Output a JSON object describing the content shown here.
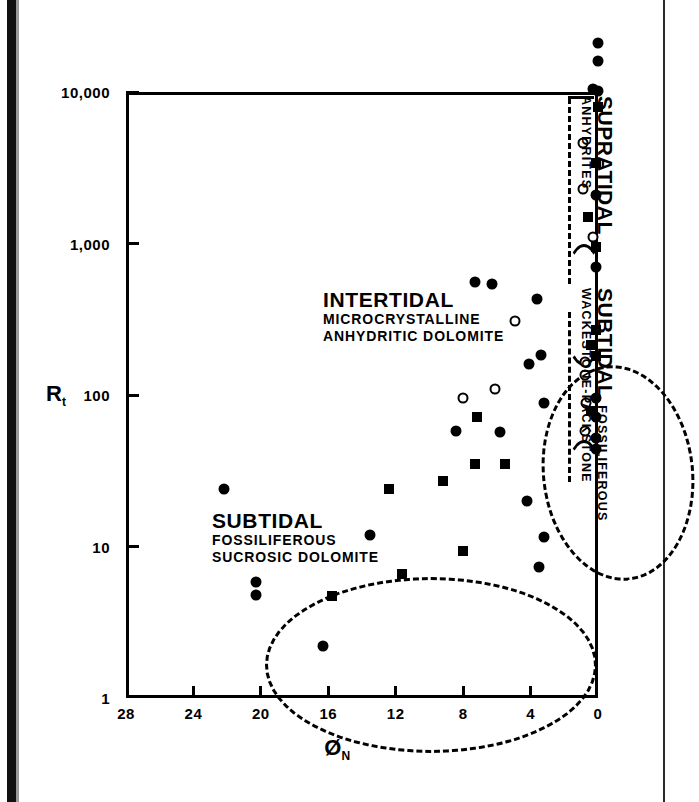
{
  "figure": {
    "type": "scatter",
    "y_axis_title": "R",
    "y_axis_title_sub": "t",
    "x_axis_title": "Ø",
    "x_axis_title_sub": "N"
  },
  "chart_data": {
    "type": "scatter",
    "title": "",
    "xlabel": "ØN",
    "ylabel": "Rt",
    "x_scale": "linear",
    "y_scale": "log",
    "xlim": [
      28,
      0
    ],
    "ylim": [
      1,
      10000
    ],
    "x_inverted": true,
    "grid": false,
    "legend": "none",
    "xticks": [
      "28",
      "24",
      "20",
      "16",
      "12",
      "8",
      "4",
      "0"
    ],
    "xtick_values": [
      28,
      24,
      20,
      16,
      12,
      8,
      4,
      0
    ],
    "yticks": [
      "1",
      "10",
      "100",
      "1,000",
      "10,000"
    ],
    "ytick_values": [
      1,
      10,
      100,
      1000,
      10000
    ],
    "marker_types": {
      "circle-filled": "filled circle",
      "circle-open": "open circle",
      "square-filled": "filled square"
    },
    "series": [
      {
        "name": "Supratidal anhydrites",
        "points": [
          {
            "x": 0.0,
            "y": 21000,
            "m": "circle-filled"
          },
          {
            "x": 0.0,
            "y": 16000,
            "m": "circle-filled"
          },
          {
            "x": 0.3,
            "y": 10500,
            "m": "circle-filled"
          },
          {
            "x": 0.0,
            "y": 10200,
            "m": "circle-filled"
          },
          {
            "x": 0.0,
            "y": 8000,
            "m": "square-filled"
          },
          {
            "x": 0.9,
            "y": 4600,
            "m": "circle-open"
          },
          {
            "x": 0.1,
            "y": 3400,
            "m": "square-filled"
          },
          {
            "x": 0.9,
            "y": 2300,
            "m": "circle-open"
          },
          {
            "x": 0.1,
            "y": 2100,
            "m": "circle-filled"
          },
          {
            "x": 0.6,
            "y": 1500,
            "m": "square-filled"
          },
          {
            "x": 0.3,
            "y": 1100,
            "m": "circle-open"
          },
          {
            "x": 0.1,
            "y": 950,
            "m": "square-filled"
          },
          {
            "x": 0.1,
            "y": 700,
            "m": "circle-filled"
          }
        ]
      },
      {
        "name": "Subtidal fossiliferous wackestone-packstone",
        "points": [
          {
            "x": 0.1,
            "y": 270,
            "m": "square-filled"
          },
          {
            "x": 0.4,
            "y": 215,
            "m": "square-filled"
          },
          {
            "x": 0.1,
            "y": 180,
            "m": "square-filled"
          },
          {
            "x": 0.8,
            "y": 165,
            "m": "circle-open"
          },
          {
            "x": 0.8,
            "y": 135,
            "m": "circle-open"
          },
          {
            "x": 0.1,
            "y": 96,
            "m": "circle-filled"
          },
          {
            "x": 0.7,
            "y": 88,
            "m": "circle-open"
          },
          {
            "x": 0.4,
            "y": 78,
            "m": "square-filled"
          },
          {
            "x": 0.1,
            "y": 72,
            "m": "circle-filled"
          },
          {
            "x": 0.8,
            "y": 58,
            "m": "circle-open"
          },
          {
            "x": 0.1,
            "y": 52,
            "m": "circle-filled"
          },
          {
            "x": 0.1,
            "y": 44,
            "m": "circle-filled"
          }
        ]
      },
      {
        "name": "Intertidal microcrystalline anhydritic dolomite",
        "points": [
          {
            "x": 7.3,
            "y": 560,
            "m": "circle-filled"
          },
          {
            "x": 6.3,
            "y": 540,
            "m": "circle-filled"
          },
          {
            "x": 3.6,
            "y": 430,
            "m": "circle-filled"
          },
          {
            "x": 4.9,
            "y": 310,
            "m": "circle-open"
          },
          {
            "x": 3.4,
            "y": 185,
            "m": "circle-filled"
          },
          {
            "x": 4.1,
            "y": 160,
            "m": "circle-filled"
          },
          {
            "x": 6.1,
            "y": 110,
            "m": "circle-open"
          },
          {
            "x": 8.0,
            "y": 95,
            "m": "circle-open"
          },
          {
            "x": 3.2,
            "y": 88,
            "m": "circle-filled"
          },
          {
            "x": 7.2,
            "y": 72,
            "m": "square-filled"
          },
          {
            "x": 8.4,
            "y": 58,
            "m": "circle-filled"
          },
          {
            "x": 5.8,
            "y": 57,
            "m": "circle-filled"
          },
          {
            "x": 7.3,
            "y": 35,
            "m": "square-filled"
          },
          {
            "x": 5.5,
            "y": 35,
            "m": "square-filled"
          }
        ]
      },
      {
        "name": "Subtidal fossiliferous sucrosic dolomite",
        "points": [
          {
            "x": 9.2,
            "y": 27,
            "m": "square-filled"
          },
          {
            "x": 22.2,
            "y": 24,
            "m": "circle-filled"
          },
          {
            "x": 12.4,
            "y": 24,
            "m": "square-filled"
          },
          {
            "x": 4.2,
            "y": 20,
            "m": "circle-filled"
          },
          {
            "x": 13.5,
            "y": 12,
            "m": "circle-filled"
          },
          {
            "x": 3.2,
            "y": 11.5,
            "m": "circle-filled"
          },
          {
            "x": 8.0,
            "y": 9.3,
            "m": "square-filled"
          },
          {
            "x": 3.5,
            "y": 7.3,
            "m": "circle-filled"
          },
          {
            "x": 11.6,
            "y": 6.6,
            "m": "square-filled"
          },
          {
            "x": 20.3,
            "y": 5.8,
            "m": "circle-filled"
          },
          {
            "x": 20.3,
            "y": 4.8,
            "m": "circle-filled"
          },
          {
            "x": 15.8,
            "y": 4.7,
            "m": "square-filled"
          },
          {
            "x": 16.3,
            "y": 2.2,
            "m": "circle-filled"
          }
        ]
      }
    ],
    "annotations": [
      {
        "id": "intertidal",
        "title": "INTERTIDAL",
        "lines": [
          "MICROCRYSTALLINE",
          "ANHYDRITIC DOLOMITE"
        ]
      },
      {
        "id": "subtidal-sucrosic",
        "title": "SUBTIDAL",
        "lines": [
          "FOSSILIFEROUS",
          "SUCROSIC DOLOMITE"
        ]
      },
      {
        "id": "supratidal",
        "title": "SUPRATIDAL",
        "lines": [
          "ANHYDRITES"
        ]
      },
      {
        "id": "subtidal-wackestone",
        "title": "SUBTIDAL",
        "lines": [
          "FOSSILIFEROUS",
          "WACKESTONE-PACKSTONE"
        ]
      }
    ]
  }
}
